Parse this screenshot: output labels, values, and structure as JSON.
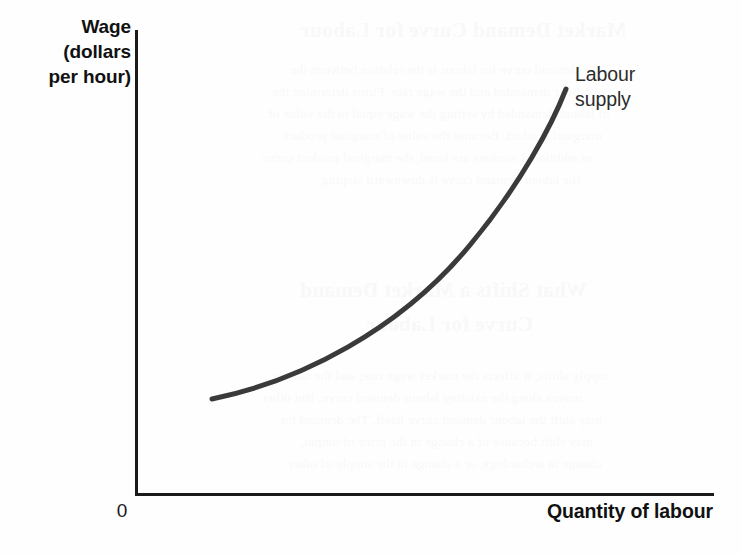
{
  "figure": {
    "background_color": "#fefefe",
    "axis_color": "#1a1a1a",
    "curve_color": "#3a3a3a",
    "origin_label": "0"
  },
  "axes": {
    "y_title_lines": [
      "Wage",
      "(dollars",
      "per hour)"
    ],
    "x_title": "Quantity of labour"
  },
  "curve": {
    "label_lines": [
      "Labour",
      "supply"
    ],
    "path": "M 212 399 C 300 381, 400 330, 470 245 C 520 185, 552 125, 566 89"
  },
  "ghost_text": {
    "heading_1": "Market Demand Curve for Labour",
    "body_1": [
      "demand curve for labour is the relation between the",
      "of labour demanded and the wage rate. Firms determine the",
      "of labour demanded by setting the wage equal to the value of",
      "marginal product. Because the value of marginal product",
      "as additional workers are hired, the marginal product curve",
      "the labour demand curve is downward sloping."
    ],
    "heading_2": "What Shifts a Market Demand",
    "heading_3": "Curve for Labour",
    "body_2": [
      "supply shifts, it affects the market wage rate, and the market",
      "moves along the existing labour demand curve. But other",
      "may shift the labour demand curve itself. The demand for",
      "may shift because of a change in the price of output,",
      "change in technology, or a change in the supply of other"
    ]
  },
  "chart_data": {
    "type": "line",
    "title": "",
    "xlabel": "Quantity of labour",
    "ylabel": "Wage (dollars per hour)",
    "series": [
      {
        "name": "Labour supply",
        "comment": "upward-sloping convex supply curve, no numeric tick values shown",
        "points": [
          {
            "x": 0.13,
            "y": 0.21
          },
          {
            "x": 0.28,
            "y": 0.27
          },
          {
            "x": 0.43,
            "y": 0.36
          },
          {
            "x": 0.58,
            "y": 0.5
          },
          {
            "x": 0.7,
            "y": 0.65
          },
          {
            "x": 0.79,
            "y": 0.79
          },
          {
            "x": 0.85,
            "y": 0.92
          }
        ]
      }
    ],
    "xlim": [
      0,
      1
    ],
    "ylim": [
      0,
      1
    ],
    "x_ticks": [],
    "y_ticks": [],
    "grid": false,
    "legend": "inline-annotation",
    "annotations": [
      "Labour supply"
    ],
    "origin_label": "0"
  }
}
